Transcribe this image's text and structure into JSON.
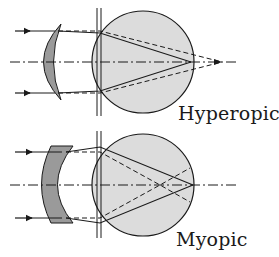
{
  "colors": {
    "eye_fill": "#dcdcdc",
    "lens_fill": "#9a9a9a",
    "stroke": "#1a1a1a",
    "background": "#ffffff"
  },
  "panels": [
    {
      "id": "hyperopic",
      "label": "Hyperopic",
      "lens_type": "converging (plus) meniscus",
      "focus_without_lens": "behind retina",
      "focus_with_lens": "on retina"
    },
    {
      "id": "myopic",
      "label": "Myopic",
      "lens_type": "diverging (minus) meniscus",
      "focus_without_lens": "in front of retina",
      "focus_with_lens": "on retina"
    }
  ],
  "legend": {
    "solid_line": "corrected ray path",
    "dashed_line": "uncorrected ray path",
    "dash_dot_line": "optical axis"
  }
}
